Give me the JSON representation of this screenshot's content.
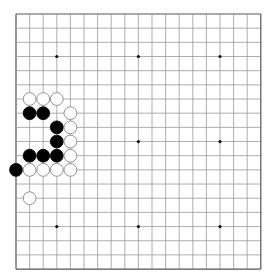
{
  "board": {
    "size": 19,
    "origin_x": 16,
    "origin_y": 14,
    "spacing_x": 13.6,
    "spacing_y": 14.17,
    "line_color": "#9a9a9a",
    "border_color": "#555555",
    "hoshi": [
      [
        3,
        3
      ],
      [
        9,
        3
      ],
      [
        15,
        3
      ],
      [
        3,
        9
      ],
      [
        9,
        9
      ],
      [
        15,
        9
      ],
      [
        3,
        15
      ],
      [
        9,
        15
      ],
      [
        15,
        15
      ]
    ],
    "stones": [
      {
        "color": "white",
        "col": 1,
        "row": 6
      },
      {
        "color": "white",
        "col": 2,
        "row": 6
      },
      {
        "color": "white",
        "col": 3,
        "row": 6
      },
      {
        "color": "black",
        "col": 1,
        "row": 7
      },
      {
        "color": "black",
        "col": 2,
        "row": 7
      },
      {
        "color": "white",
        "col": 4,
        "row": 7
      },
      {
        "color": "black",
        "col": 3,
        "row": 8
      },
      {
        "color": "white",
        "col": 4,
        "row": 8
      },
      {
        "color": "black",
        "col": 3,
        "row": 9
      },
      {
        "color": "white",
        "col": 4,
        "row": 9
      },
      {
        "color": "black",
        "col": 1,
        "row": 10
      },
      {
        "color": "black",
        "col": 2,
        "row": 10
      },
      {
        "color": "black",
        "col": 3,
        "row": 10
      },
      {
        "color": "white",
        "col": 4,
        "row": 10
      },
      {
        "color": "black",
        "col": 0,
        "row": 11
      },
      {
        "color": "white",
        "col": 1,
        "row": 11
      },
      {
        "color": "white",
        "col": 2,
        "row": 11
      },
      {
        "color": "white",
        "col": 3,
        "row": 11
      },
      {
        "color": "white",
        "col": 4,
        "row": 11
      },
      {
        "color": "white",
        "col": 1,
        "row": 13
      }
    ]
  }
}
